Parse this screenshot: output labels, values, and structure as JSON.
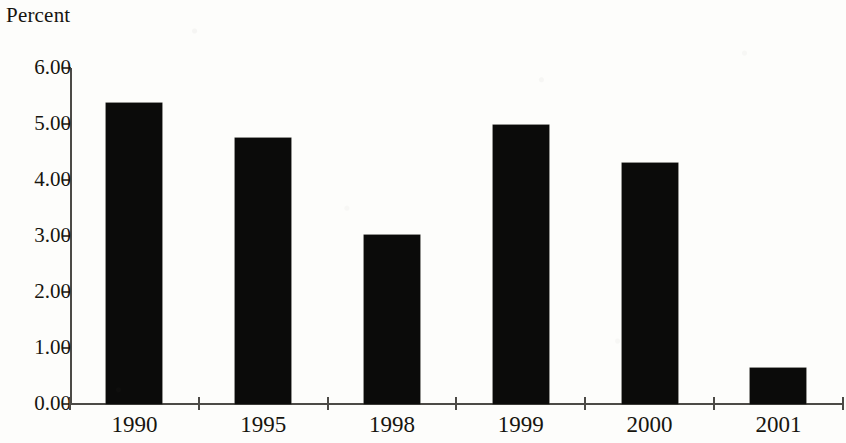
{
  "chart_data": {
    "type": "bar",
    "title": "Percent",
    "xlabel": "",
    "ylabel": "Percent",
    "categories": [
      "1990",
      "1995",
      "1998",
      "1999",
      "2000",
      "2001"
    ],
    "values": [
      5.38,
      4.75,
      3.02,
      4.98,
      4.3,
      0.64
    ],
    "series": [
      {
        "name": "Percent",
        "values": [
          5.38,
          4.75,
          3.02,
          4.98,
          4.3,
          0.64
        ]
      }
    ],
    "ylim": [
      0.0,
      6.0
    ],
    "ytick_values": [
      6.0,
      5.0,
      4.0,
      3.0,
      2.0,
      1.0,
      0.0
    ],
    "ytick_labels": [
      "6.00",
      "5.00",
      "4.00",
      "3.00",
      "2.00",
      "1.00",
      "0.00"
    ],
    "grid": false,
    "legend": false,
    "legend_position": "none",
    "bar_color": "#0b0b0a",
    "axis_color": "#4c4a46",
    "background_color": "#fdfdfb",
    "text_color": "#17150f"
  }
}
